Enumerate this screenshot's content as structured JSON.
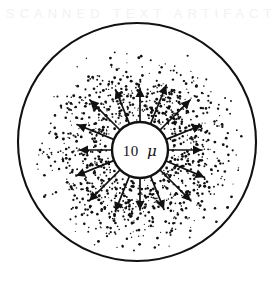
{
  "figure": {
    "name": "radial-diffusion-diagram",
    "background_color": "#ffffff",
    "ink_color": "#111111",
    "canvas": {
      "width": 277,
      "height": 286
    }
  },
  "outer_circle": {
    "label": "field-boundary",
    "cx": 137,
    "cy": 142,
    "r": 119,
    "stroke_width": 2.1,
    "fill": "none"
  },
  "inner_circle": {
    "label": "central-body",
    "cx": 140,
    "cy": 150,
    "r": 28,
    "stroke_width": 2.4,
    "fill": "#ffffff"
  },
  "scale_label": {
    "value": "10",
    "unit": "μ",
    "full_text": "10 μ",
    "x": 140,
    "y": 156
  },
  "arrows": {
    "count": 16,
    "origin_radius": 29,
    "tip_radius_min": 58,
    "tip_radius_max": 72,
    "stroke_width": 1.7,
    "head_length": 9,
    "head_width": 4.6,
    "angles_deg": [
      0,
      22,
      45,
      68,
      90,
      113,
      135,
      158,
      180,
      202,
      225,
      248,
      270,
      292,
      315,
      338
    ],
    "tip_radii": [
      62,
      70,
      71,
      66,
      62,
      70,
      72,
      64,
      60,
      66,
      72,
      69,
      61,
      68,
      71,
      65
    ]
  },
  "stipple": {
    "label": "particle-cloud",
    "dot_count": 1150,
    "inner_radius": 30,
    "outer_radius": 107,
    "dot_radius_min": 0.55,
    "dot_radius_max": 1.5,
    "color": "#111111"
  },
  "ghost_artifact": {
    "text": "SCANNED TEXT ARTIFACT",
    "color": "#f2f2f2",
    "visible": true
  },
  "chart_data": {
    "type": "scatter",
    "title": "10 μ",
    "subtitle": "",
    "xlabel": "",
    "ylabel": "",
    "legend": [],
    "annotations": [
      "10 μ"
    ],
    "series": [
      {
        "name": "radial-arrows",
        "kind": "vector",
        "count": 16,
        "values": [
          0,
          22,
          45,
          68,
          90,
          113,
          135,
          158,
          180,
          202,
          225,
          248,
          270,
          292,
          315,
          338
        ]
      },
      {
        "name": "stipple-density",
        "kind": "radial-density",
        "categories": [
          "30-45",
          "45-60",
          "60-75",
          "75-90",
          "90-107"
        ],
        "values": [
          100,
          72,
          48,
          26,
          10
        ]
      }
    ],
    "grid": false
  }
}
